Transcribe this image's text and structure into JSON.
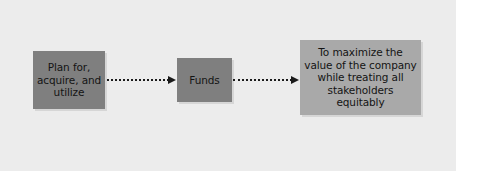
{
  "diagram": {
    "type": "flow",
    "nodes": [
      {
        "id": "plan",
        "label": "Plan for,\nacquire, and\nutilize",
        "style": "dark",
        "color": "#7f7f7f"
      },
      {
        "id": "funds",
        "label": "Funds",
        "style": "dark",
        "color": "#7f7f7f"
      },
      {
        "id": "goal",
        "label": "To maximize the\nvalue of the company\nwhile treating all\nstakeholders\nequitably",
        "style": "light",
        "color": "#a9a9a9"
      }
    ],
    "edges": [
      {
        "from": "plan",
        "to": "funds",
        "style": "dotted-arrow"
      },
      {
        "from": "funds",
        "to": "goal",
        "style": "dotted-arrow"
      }
    ],
    "background_color": "#ececec"
  }
}
